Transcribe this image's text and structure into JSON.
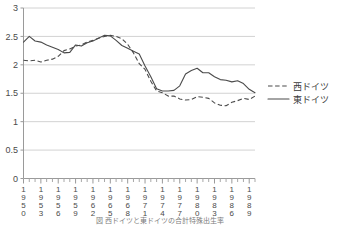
{
  "chart_data": {
    "type": "line",
    "title": "",
    "xlabel": "",
    "ylabel": "",
    "ylim": [
      0,
      3
    ],
    "xlim": [
      1950,
      1990
    ],
    "grid": true,
    "legend_position": "right",
    "ytick_labels": [
      "3",
      "2.5",
      "2",
      "1.5",
      "1",
      "0.5",
      "0"
    ],
    "ytick_values": [
      3,
      2.5,
      2,
      1.5,
      1,
      0.5,
      0
    ],
    "xtick_labels": [
      "1950",
      "1953",
      "1956",
      "1959",
      "1962",
      "1965",
      "1968",
      "1971",
      "1974",
      "1977",
      "1980",
      "1983",
      "1986",
      "1989"
    ],
    "xtick_values": [
      1950,
      1953,
      1956,
      1959,
      1962,
      1965,
      1968,
      1971,
      1974,
      1977,
      1980,
      1983,
      1986,
      1989
    ],
    "x": [
      1950,
      1951,
      1952,
      1953,
      1954,
      1955,
      1956,
      1957,
      1958,
      1959,
      1960,
      1961,
      1962,
      1963,
      1964,
      1965,
      1966,
      1967,
      1968,
      1969,
      1970,
      1971,
      1972,
      1973,
      1974,
      1975,
      1976,
      1977,
      1978,
      1979,
      1980,
      1981,
      1982,
      1983,
      1984,
      1985,
      1986,
      1987,
      1988,
      1989,
      1990
    ],
    "series": [
      {
        "name": "西ドイツ",
        "style": "dashed",
        "color": "#4a4a4a",
        "values": [
          2.08,
          2.07,
          2.08,
          2.05,
          2.08,
          2.1,
          2.15,
          2.25,
          2.28,
          2.33,
          2.35,
          2.4,
          2.43,
          2.47,
          2.5,
          2.52,
          2.5,
          2.46,
          2.36,
          2.21,
          2.02,
          1.92,
          1.71,
          1.54,
          1.51,
          1.45,
          1.45,
          1.4,
          1.38,
          1.39,
          1.44,
          1.43,
          1.41,
          1.33,
          1.29,
          1.28,
          1.34,
          1.37,
          1.41,
          1.39,
          1.45
        ]
      },
      {
        "name": "東ドイツ",
        "style": "solid",
        "color": "#4a4a4a",
        "values": [
          2.4,
          2.5,
          2.42,
          2.4,
          2.35,
          2.31,
          2.27,
          2.21,
          2.22,
          2.35,
          2.33,
          2.39,
          2.42,
          2.47,
          2.52,
          2.51,
          2.43,
          2.34,
          2.29,
          2.24,
          2.19,
          1.98,
          1.79,
          1.58,
          1.54,
          1.54,
          1.55,
          1.63,
          1.84,
          1.9,
          1.94,
          1.86,
          1.86,
          1.79,
          1.74,
          1.73,
          1.7,
          1.72,
          1.67,
          1.57,
          1.51
        ]
      }
    ]
  },
  "legend": {
    "entries": [
      {
        "label": "西ドイツ",
        "style": "dashed"
      },
      {
        "label": "東ドイツ",
        "style": "solid"
      }
    ]
  },
  "caption": {
    "text": "図  西ドイツと東ドイツの合計特殊出生率"
  }
}
